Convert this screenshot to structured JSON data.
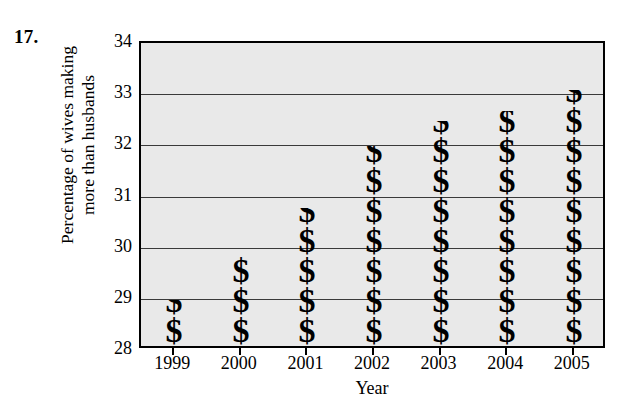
{
  "problem": {
    "number": "17."
  },
  "chart_data": {
    "type": "bar",
    "title": "",
    "subtitle": "",
    "xlabel": "Year",
    "ylabel": "Percentage of wives making more than husbands",
    "ylabel_lines": [
      "Percentage of wives making",
      "more than husbands"
    ],
    "categories": [
      "1999",
      "2000",
      "2001",
      "2002",
      "2003",
      "2004",
      "2005"
    ],
    "values": [
      28.9,
      29.9,
      30.7,
      31.9,
      32.4,
      32.6,
      33.0
    ],
    "ylim": [
      28,
      34
    ],
    "ytick_labels": [
      "28",
      "29",
      "30",
      "31",
      "32",
      "33",
      "34"
    ],
    "yticks": [
      28,
      29,
      30,
      31,
      32,
      33,
      34
    ],
    "gridlines": [
      29,
      30,
      31,
      32,
      33
    ],
    "grid": true,
    "legend": "none",
    "pictogram": true,
    "symbol_name": "dollar-sign-pictogram",
    "symbol_glyph": "$",
    "symbols_per_bar": [
      2,
      4,
      5,
      8,
      9,
      9,
      10
    ],
    "colors": {
      "plot_background": "#e9e9e9",
      "bar": "#000000",
      "gridline": "#3a3a3a",
      "frame": "#000000",
      "page_background": "#ffffff",
      "text": "#000000"
    }
  }
}
